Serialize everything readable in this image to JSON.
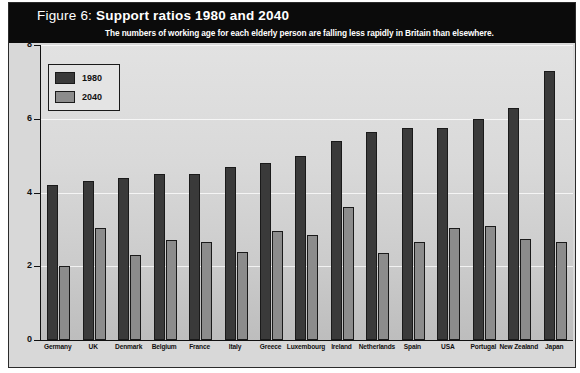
{
  "figure": {
    "title_prefix": "Figure 6:",
    "title_main": "Support ratios 1980 and 2040",
    "subtitle": "The numbers of working age for each elderly person are falling less rapidly in Britain than elsewhere."
  },
  "legend": {
    "entries": [
      {
        "label": "1980",
        "color": "#3a3a3a"
      },
      {
        "label": "2040",
        "color": "#8c8c8c"
      }
    ]
  },
  "axis": {
    "y_title": "Ratio of number aged 15-64 to number aged 65 plus",
    "y_ticks": [
      "8",
      "6",
      "4",
      "2",
      "0"
    ]
  },
  "chart_data": {
    "type": "bar",
    "title": "Support ratios 1980 and 2040",
    "subtitle": "The numbers of working age for each elderly person are falling less rapidly in Britain than elsewhere.",
    "xlabel": "",
    "ylabel": "Ratio of number aged 15-64 to number aged 65 plus",
    "ylim": [
      0,
      8
    ],
    "yticks": [
      0,
      2,
      4,
      6,
      8
    ],
    "grid": true,
    "legend_position": "top-left",
    "categories": [
      "Germany",
      "UK",
      "Denmark",
      "Belgium",
      "France",
      "Italy",
      "Greece",
      "Luxembourg",
      "Ireland",
      "Netherlands",
      "Spain",
      "USA",
      "Portugal",
      "New Zealand",
      "Japan"
    ],
    "series": [
      {
        "name": "1980",
        "color": "#3a3a3a",
        "values": [
          4.2,
          4.3,
          4.4,
          4.5,
          4.5,
          4.7,
          4.8,
          5.0,
          5.4,
          5.65,
          5.75,
          5.75,
          6.0,
          6.3,
          7.3
        ]
      },
      {
        "name": "2040",
        "color": "#8c8c8c",
        "values": [
          2.0,
          3.05,
          2.3,
          2.7,
          2.65,
          2.4,
          2.95,
          2.85,
          3.6,
          2.35,
          2.65,
          3.05,
          3.1,
          2.75,
          2.65
        ]
      }
    ]
  }
}
